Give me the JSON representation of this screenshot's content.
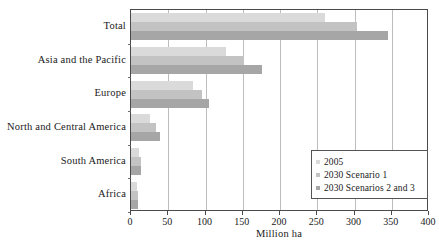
{
  "chart_data": {
    "type": "bar",
    "orientation": "horizontal",
    "title": "",
    "xlabel": "Million ha",
    "ylabel": "",
    "xlim": [
      0,
      400
    ],
    "xticks": [
      0,
      50,
      100,
      150,
      200,
      250,
      300,
      350,
      400
    ],
    "grid": true,
    "legend_position": "inside-bottom-right",
    "categories": [
      "Total",
      "Asia and the Pacific",
      "Europe",
      "North and Central America",
      "South America",
      "Africa"
    ],
    "series": [
      {
        "name": "2005",
        "color": "#dadada",
        "values": [
          260,
          128,
          83,
          26,
          11,
          8
        ]
      },
      {
        "name": "2030 Scenario 1",
        "color": "#c3c3c3",
        "values": [
          303,
          152,
          95,
          33,
          13,
          9
        ]
      },
      {
        "name": "2030 Scenarios 2 and 3",
        "color": "#a6a6a6",
        "values": [
          345,
          176,
          105,
          39,
          14,
          10
        ]
      }
    ]
  },
  "axis": {
    "x_title": "Million ha",
    "tick_labels": [
      "0",
      "50",
      "100",
      "150",
      "200",
      "250",
      "300",
      "350",
      "400"
    ]
  },
  "legend": {
    "entries": [
      {
        "label": "2005",
        "color": "#dadada"
      },
      {
        "label": "2030 Scenario 1",
        "color": "#c3c3c3"
      },
      {
        "label": "2030 Scenarios 2 and 3",
        "color": "#a6a6a6"
      }
    ]
  },
  "colors": {
    "series_2005": "#dadada",
    "series_2030_s1": "#c3c3c3",
    "series_2030_s23": "#a6a6a6",
    "axis": "#4a4a4a",
    "grid": "#bdbdbd",
    "text": "#1a1a1a"
  }
}
